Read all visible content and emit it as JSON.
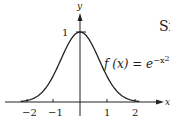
{
  "chart_data": {
    "type": "line",
    "title": "",
    "xlabel": "x",
    "ylabel": "y",
    "xlim": [
      -2.4,
      2.6
    ],
    "ylim": [
      0,
      1.2
    ],
    "x_ticks": [
      "-2",
      "-1",
      "1",
      "2"
    ],
    "y_ticks": [
      "1"
    ],
    "grid": false,
    "series": [
      {
        "name": "f(x) = e^{-x^2}",
        "x": [
          -2.2,
          -2,
          -1.5,
          -1,
          -0.5,
          0,
          0.5,
          1,
          1.5,
          2,
          2.2
        ],
        "values": [
          0.008,
          0.018,
          0.105,
          0.368,
          0.779,
          1.0,
          0.779,
          0.368,
          0.105,
          0.018,
          0.008
        ]
      }
    ],
    "annotations": [
      {
        "text": "f (x) = e^{-x^2}",
        "position": "right of curve near x=1, y=0.7"
      }
    ]
  },
  "labels": {
    "y_axis": "y",
    "x_axis": "x",
    "tick_neg2": "−2",
    "tick_neg1": "−1",
    "tick_1": "1",
    "tick_2": "2",
    "y_tick_1": "1",
    "formula_main": "f (x) = e",
    "formula_exp": "−x",
    "formula_exp_pow": "2",
    "side_text": "Si"
  }
}
